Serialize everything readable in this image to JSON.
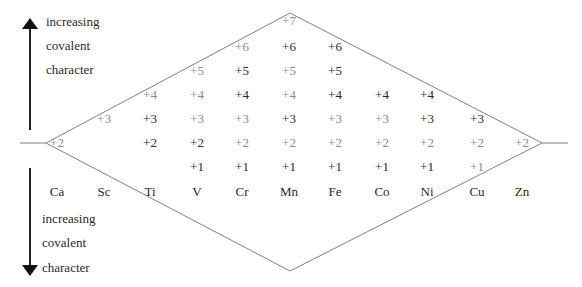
{
  "top_note": {
    "lines": [
      "increasing",
      "covalent",
      "character"
    ],
    "arrow": "up-arrow"
  },
  "bottom_note": {
    "lines": [
      "increasing",
      "covalent",
      "character"
    ],
    "arrow": "down-arrow"
  },
  "colors": {
    "strong": "#2a2a2a",
    "weak": "#8a8a8a",
    "line": "#808080"
  },
  "elements": [
    {
      "symbol": "Ca",
      "states": [
        {
          "v": "+2",
          "strong": false
        }
      ]
    },
    {
      "symbol": "Sc",
      "states": [
        {
          "v": "+3",
          "strong": false
        }
      ]
    },
    {
      "symbol": "Ti",
      "states": [
        {
          "v": "+4",
          "strong": false
        },
        {
          "v": "+3",
          "strong": true
        },
        {
          "v": "+2",
          "strong": true
        }
      ]
    },
    {
      "symbol": "V",
      "states": [
        {
          "v": "+5",
          "strong": false
        },
        {
          "v": "+4",
          "strong": false
        },
        {
          "v": "+3",
          "strong": false
        },
        {
          "v": "+2",
          "strong": true
        },
        {
          "v": "+1",
          "strong": true
        }
      ]
    },
    {
      "symbol": "Cr",
      "states": [
        {
          "v": "+6",
          "strong": false
        },
        {
          "v": "+5",
          "strong": true
        },
        {
          "v": "+4",
          "strong": true
        },
        {
          "v": "+3",
          "strong": false
        },
        {
          "v": "+2",
          "strong": false
        },
        {
          "v": "+1",
          "strong": true
        }
      ]
    },
    {
      "symbol": "Mn",
      "states": [
        {
          "v": "+7",
          "strong": false
        },
        {
          "v": "+6",
          "strong": true
        },
        {
          "v": "+5",
          "strong": false
        },
        {
          "v": "+4",
          "strong": false
        },
        {
          "v": "+3",
          "strong": true
        },
        {
          "v": "+2",
          "strong": false
        },
        {
          "v": "+1",
          "strong": true
        }
      ]
    },
    {
      "symbol": "Fe",
      "states": [
        {
          "v": "+6",
          "strong": true
        },
        {
          "v": "+5",
          "strong": true
        },
        {
          "v": "+4",
          "strong": true
        },
        {
          "v": "+3",
          "strong": false
        },
        {
          "v": "+2",
          "strong": false
        },
        {
          "v": "+1",
          "strong": true
        }
      ]
    },
    {
      "symbol": "Co",
      "states": [
        {
          "v": "+4",
          "strong": true
        },
        {
          "v": "+3",
          "strong": false
        },
        {
          "v": "+2",
          "strong": false
        },
        {
          "v": "+1",
          "strong": true
        }
      ]
    },
    {
      "symbol": "Ni",
      "states": [
        {
          "v": "+4",
          "strong": true
        },
        {
          "v": "+3",
          "strong": true
        },
        {
          "v": "+2",
          "strong": false
        },
        {
          "v": "+1",
          "strong": true
        }
      ]
    },
    {
      "symbol": "Cu",
      "states": [
        {
          "v": "+3",
          "strong": true
        },
        {
          "v": "+2",
          "strong": false
        },
        {
          "v": "+1",
          "strong": false
        }
      ]
    },
    {
      "symbol": "Zn",
      "states": [
        {
          "v": "+2",
          "strong": false
        }
      ]
    }
  ]
}
